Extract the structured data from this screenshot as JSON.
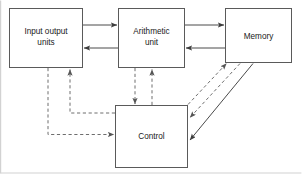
{
  "diagram": {
    "colors": {
      "background": "#ffffff",
      "box_stroke": "#5a5a5a",
      "solid_edge": "#4a4a4a",
      "dashed_edge": "#6e6e6e",
      "text": "#1a1a1a",
      "frame": "#d2d2d2"
    },
    "nodes": [
      {
        "id": "input-output-units",
        "lines": [
          "Input output",
          "units"
        ],
        "line1": "Input output",
        "line2": "units",
        "x": 9,
        "y": 8,
        "width": 74,
        "height": 60
      },
      {
        "id": "arithmetic-unit",
        "lines": [
          "Arithmetic",
          "unit"
        ],
        "line1": "Arithmetic",
        "line2": "unit",
        "x": 118,
        "y": 8,
        "width": 67,
        "height": 60
      },
      {
        "id": "memory",
        "lines": [
          "Memory"
        ],
        "line1": "Memory",
        "line2": "",
        "x": 225,
        "y": 8,
        "width": 67,
        "height": 55
      },
      {
        "id": "control",
        "lines": [
          "Control"
        ],
        "line1": "Control",
        "line2": "",
        "x": 115,
        "y": 105,
        "width": 73,
        "height": 63
      }
    ],
    "edges": [
      {
        "id": "io-to-arithmetic",
        "from": "input-output-units",
        "to": "arithmetic-unit",
        "style": "solid",
        "direction": "right"
      },
      {
        "id": "arithmetic-to-io",
        "from": "arithmetic-unit",
        "to": "input-output-units",
        "style": "solid",
        "direction": "left"
      },
      {
        "id": "arithmetic-to-memory",
        "from": "arithmetic-unit",
        "to": "memory",
        "style": "solid",
        "direction": "right"
      },
      {
        "id": "memory-to-arithmetic",
        "from": "memory",
        "to": "arithmetic-unit",
        "style": "solid",
        "direction": "left"
      },
      {
        "id": "io-to-control",
        "from": "input-output-units",
        "to": "control",
        "style": "dashed",
        "direction": "down-right"
      },
      {
        "id": "control-to-io",
        "from": "control",
        "to": "input-output-units",
        "style": "dashed",
        "direction": "up-left"
      },
      {
        "id": "arithmetic-to-control",
        "from": "arithmetic-unit",
        "to": "control",
        "style": "dashed",
        "direction": "down"
      },
      {
        "id": "control-to-arithmetic",
        "from": "control",
        "to": "arithmetic-unit",
        "style": "dashed",
        "direction": "up"
      },
      {
        "id": "control-to-memory",
        "from": "control",
        "to": "memory",
        "style": "dashed",
        "direction": "up-right"
      },
      {
        "id": "memory-to-control-dashed",
        "from": "memory",
        "to": "control",
        "style": "dashed",
        "direction": "down-left"
      },
      {
        "id": "memory-to-control-solid",
        "from": "memory",
        "to": "control",
        "style": "solid",
        "direction": "down-left"
      }
    ]
  }
}
